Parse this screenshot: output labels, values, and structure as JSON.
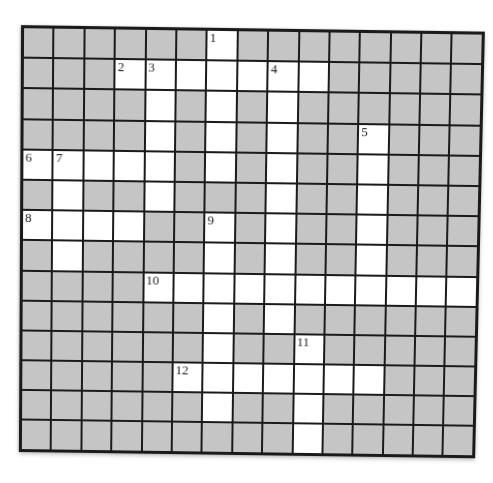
{
  "page": {
    "kind": "crossword-puzzle-grid",
    "background": "#ffffff"
  },
  "grid": {
    "rows": 14,
    "cols": 15,
    "cells": [
      "######.########",
      "###.......#####",
      "####.#.#.######",
      "####.#.#.##.###",
      ".....#.#.##.###",
      "#.##.###.##.###",
      "....##.#.##.###",
      "#.####.#.##.###",
      "####...........",
      "######.#.######",
      "######.##.#####",
      "#####.......###",
      "######.##.#####",
      "#########.#####"
    ],
    "numbers": [
      {
        "row": 0,
        "col": 6,
        "label": "1"
      },
      {
        "row": 1,
        "col": 3,
        "label": "2"
      },
      {
        "row": 1,
        "col": 4,
        "label": "3"
      },
      {
        "row": 1,
        "col": 8,
        "label": "4"
      },
      {
        "row": 3,
        "col": 11,
        "label": "5"
      },
      {
        "row": 4,
        "col": 0,
        "label": "6"
      },
      {
        "row": 4,
        "col": 1,
        "label": "7"
      },
      {
        "row": 6,
        "col": 0,
        "label": "8"
      },
      {
        "row": 6,
        "col": 6,
        "label": "9"
      },
      {
        "row": 8,
        "col": 4,
        "label": "10"
      },
      {
        "row": 10,
        "col": 9,
        "label": "11"
      },
      {
        "row": 11,
        "col": 5,
        "label": "12"
      }
    ],
    "colors": {
      "blocked": "#c5c5c5",
      "open": "#ffffff",
      "line": "#1a1a1a",
      "number": "#1b1b1b"
    }
  }
}
